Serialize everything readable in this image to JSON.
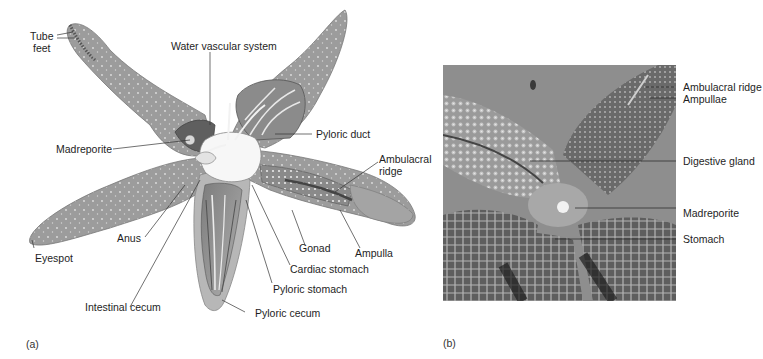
{
  "figure": {
    "panel_a": {
      "tag": "(a)",
      "labels": {
        "tube_feet": "Tube\nfeet",
        "water_vascular_system": "Water vascular system",
        "madreporite": "Madreporite",
        "pyloric_duct": "Pyloric duct",
        "ambulacral_ridge": "Ambulacral\nridge",
        "anus": "Anus",
        "eyespot": "Eyespot",
        "gonad": "Gonad",
        "ampulla": "Ampulla",
        "cardiac_stomach": "Cardiac stomach",
        "pyloric_stomach": "Pyloric stomach",
        "intestinal_cecum": "Intestinal cecum",
        "pyloric_cecum": "Pyloric cecum"
      }
    },
    "panel_b": {
      "tag": "(b)",
      "labels": {
        "ambulacral_ridge": "Ambulacral ridge",
        "ampullae": "Ampullae",
        "digestive_gland": "Digestive gland",
        "madreporite": "Madreporite",
        "stomach": "Stomach"
      }
    }
  },
  "colors": {
    "arm_fill": "#9a9a9a",
    "arm_dark": "#6f6f6f",
    "arm_light": "#c9c9c9",
    "photo_bg": "#8c8c8c",
    "leader_line": "#333333"
  }
}
